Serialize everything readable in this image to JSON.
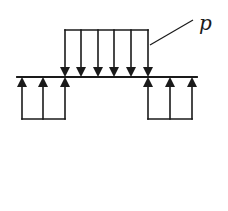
{
  "diagram": {
    "type": "load-diagram",
    "load_label": "p",
    "colors": {
      "line": "#1a1a1a",
      "background": "#ffffff"
    },
    "beam": {
      "x1": 17,
      "x2": 197,
      "y": 77
    },
    "applied_load": {
      "direction": "down",
      "box_top": 30,
      "x_positions": [
        65,
        81,
        98,
        114,
        131,
        148
      ]
    },
    "reactions": [
      {
        "side": "left",
        "direction": "up",
        "box_bottom": 119,
        "x_positions": [
          22,
          43,
          65
        ]
      },
      {
        "side": "right",
        "direction": "up",
        "box_bottom": 119,
        "x_positions": [
          148,
          170,
          192
        ]
      }
    ],
    "leader": {
      "x1": 150,
      "y1": 45,
      "x2": 193,
      "y2": 20
    },
    "label_pos": {
      "x": 199,
      "y": 30
    }
  }
}
